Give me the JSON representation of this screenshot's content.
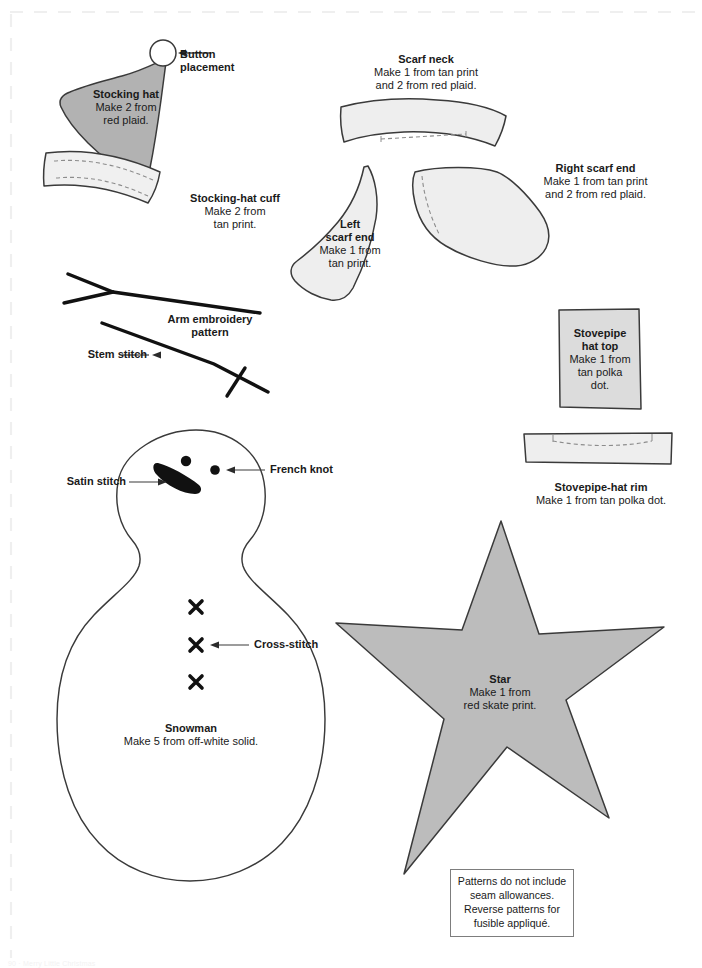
{
  "page": {
    "footer_text": "90 · Merry Little Christmas",
    "cut_border": "dashed-trim-line"
  },
  "colors": {
    "hat_fill": "#b2b2b2",
    "piece_fill": "#eeeeee",
    "star_fill": "#bcbcbc",
    "outline": "#3a3a3a",
    "stitch_dash": "#8c8c8c",
    "ink": "#111111",
    "leader": "#4a4a4a",
    "trim_line": "#efefef"
  },
  "pieces": {
    "stocking_hat": {
      "title": "Stocking hat",
      "instruction_1": "Make 2 from",
      "instruction_2": "red plaid."
    },
    "button_placement": {
      "label_1": "Button",
      "label_2": "placement"
    },
    "stocking_hat_cuff": {
      "title": "Stocking-hat cuff",
      "instruction_1": "Make 2 from",
      "instruction_2": "tan print."
    },
    "scarf_neck": {
      "title": "Scarf neck",
      "instruction_1": "Make 1 from tan print",
      "instruction_2": "and 2 from red plaid."
    },
    "left_scarf_end": {
      "title_1": "Left",
      "title_2": "scarf end",
      "instruction_1": "Make 1 from",
      "instruction_2": "tan print."
    },
    "right_scarf_end": {
      "title": "Right scarf end",
      "instruction_1": "Make 1 from tan print",
      "instruction_2": "and 2 from red plaid."
    },
    "stovepipe_hat_top": {
      "title_1": "Stovepipe",
      "title_2": "hat top",
      "instruction_1": "Make 1 from",
      "instruction_2": "tan polka",
      "instruction_3": "dot."
    },
    "stovepipe_hat_rim": {
      "title": "Stovepipe-hat rim",
      "instruction": "Make 1 from tan polka dot."
    },
    "snowman": {
      "title": "Snowman",
      "instruction": "Make 5 from off-white solid."
    },
    "star": {
      "title": "Star",
      "instruction_1": "Make 1 from",
      "instruction_2": "red skate print."
    }
  },
  "embroidery": {
    "arm_pattern": {
      "title_1": "Arm embroidery",
      "title_2": "pattern"
    },
    "stem_stitch": "Stem stitch",
    "satin_stitch": "Satin stitch",
    "french_knot": "French knot",
    "cross_stitch": "Cross-stitch"
  },
  "note_box": {
    "line_1": "Patterns do not include",
    "line_2": "seam allowances.",
    "line_3": "Reverse patterns for",
    "line_4": "fusible appliqué."
  }
}
